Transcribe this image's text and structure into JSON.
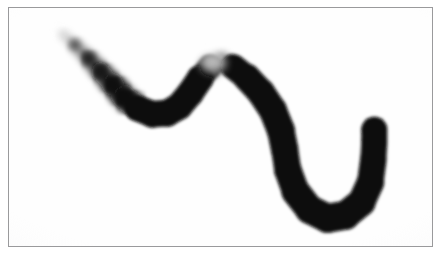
{
  "image": {
    "kind": "scanned-ink-stroke-plate",
    "width": 442,
    "height": 258,
    "background_color": "#ffffff",
    "caption": ""
  },
  "frame": {
    "border_color": "#9a9a9c",
    "border_width_px": 1,
    "fill_color": "#fefefe",
    "x": 8,
    "y": 7,
    "width": 425,
    "height": 240
  },
  "stroke": {
    "name": "serpentine-brush-stroke",
    "ink_color": "#0a0a0a",
    "faded_color": "#b4b4b6",
    "start_point": [
      62,
      33
    ],
    "end_point": [
      375,
      130
    ],
    "max_width_px": 30,
    "min_width_px": 7,
    "description": "thick black ink brush stroke, tapered faded start at upper-left, descends to a rounded valley, rises to a hump with a light break at its apex, descends steeply at right, then curves into a U hook ending in a rounded cap",
    "path_points": [
      [
        62,
        33
      ],
      [
        74,
        44
      ],
      [
        88,
        58
      ],
      [
        100,
        71
      ],
      [
        112,
        84
      ],
      [
        124,
        97
      ],
      [
        137,
        108
      ],
      [
        152,
        114
      ],
      [
        167,
        113
      ],
      [
        179,
        106
      ],
      [
        190,
        93
      ],
      [
        200,
        78
      ],
      [
        210,
        66
      ],
      [
        221,
        62
      ],
      [
        233,
        66
      ],
      [
        247,
        77
      ],
      [
        261,
        92
      ],
      [
        273,
        110
      ],
      [
        281,
        130
      ],
      [
        285,
        150
      ],
      [
        288,
        170
      ],
      [
        296,
        192
      ],
      [
        310,
        210
      ],
      [
        328,
        219
      ],
      [
        346,
        216
      ],
      [
        362,
        203
      ],
      [
        371,
        183
      ],
      [
        374,
        160
      ],
      [
        375,
        142
      ],
      [
        375,
        130
      ]
    ],
    "widths": [
      7,
      11,
      15,
      19,
      22,
      24,
      26,
      27,
      27,
      27,
      27,
      27,
      22,
      20,
      24,
      27,
      28,
      28,
      28,
      27,
      27,
      28,
      29,
      29,
      29,
      28,
      27,
      26,
      26,
      26
    ],
    "opacities": [
      0.18,
      0.32,
      0.5,
      0.66,
      0.8,
      0.9,
      0.96,
      1.0,
      1.0,
      1.0,
      1.0,
      1.0,
      0.55,
      0.62,
      0.96,
      1.0,
      1.0,
      1.0,
      1.0,
      1.0,
      1.0,
      1.0,
      1.0,
      1.0,
      1.0,
      1.0,
      1.0,
      1.0,
      1.0,
      1.0
    ]
  },
  "apex_break": {
    "name": "light-gap-at-hump-apex",
    "center": [
      213,
      62
    ],
    "radius_px": 13,
    "lightness": 0.72
  },
  "end_cap": {
    "name": "rounded-terminal-cap",
    "center": [
      375,
      130
    ],
    "radius_px": 13
  }
}
